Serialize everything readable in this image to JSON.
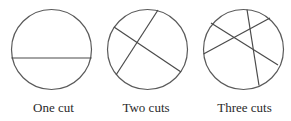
{
  "figure": {
    "panels": [
      {
        "label": "One cut",
        "circle": {
          "cx": 51.5,
          "cy": 49.5,
          "r": 40
        },
        "cuts": [
          {
            "x1": 11.5,
            "y1": 58,
            "x2": 91.5,
            "y2": 58
          }
        ],
        "label_x": 53.5
      },
      {
        "label": "Two cuts",
        "circle": {
          "cx": 147.5,
          "cy": 49.5,
          "r": 40
        },
        "cuts": [
          {
            "x1": 114,
            "y1": 27,
            "x2": 181,
            "y2": 72
          },
          {
            "x1": 158,
            "y1": 10,
            "x2": 116,
            "y2": 75
          }
        ],
        "label_x": 146
      },
      {
        "label": "Three cuts",
        "circle": {
          "cx": 243.5,
          "cy": 49.5,
          "r": 40
        },
        "cuts": [
          {
            "x1": 211,
            "y1": 23,
            "x2": 278,
            "y2": 65
          },
          {
            "x1": 203.5,
            "y1": 54,
            "x2": 270,
            "y2": 18
          },
          {
            "x1": 247,
            "y1": 9.5,
            "x2": 259,
            "y2": 85.5
          }
        ],
        "label_x": 244.5
      }
    ],
    "colors": {
      "stroke": "#4a4a4a",
      "text": "#2a2a2a",
      "background": "#ffffff"
    }
  }
}
